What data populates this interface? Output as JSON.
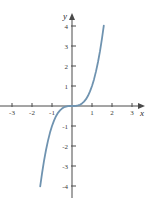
{
  "figure": {
    "background_color": "#ffffff",
    "axis_color": "#4a4a4a",
    "tick_label_color": "#3b3b3b",
    "curve_color": "#6f93b0"
  },
  "chart_data": {
    "type": "line",
    "title": "",
    "xlabel": "x",
    "ylabel": "y",
    "function": "y = x^3",
    "grid": false,
    "legend": null,
    "xlim": [
      -3.6,
      3.6
    ],
    "ylim": [
      -4.6,
      4.6
    ],
    "xticks": [
      -3,
      -2,
      -1,
      1,
      2,
      3
    ],
    "yticks": [
      -4,
      -3,
      -2,
      -1,
      1,
      2,
      3,
      4
    ],
    "xtick_labels": [
      "-3",
      "-2",
      "-1",
      "1",
      "2",
      "3"
    ],
    "ytick_labels": [
      "-4",
      "-3",
      "-2",
      "-1",
      "1",
      "2",
      "3",
      "4"
    ],
    "x": [
      -1.59,
      -1.5,
      -1.4,
      -1.3,
      -1.2,
      -1.1,
      -1.0,
      -0.9,
      -0.8,
      -0.7,
      -0.6,
      -0.5,
      -0.4,
      -0.3,
      -0.2,
      -0.1,
      0.0,
      0.1,
      0.2,
      0.3,
      0.4,
      0.5,
      0.6,
      0.7,
      0.8,
      0.9,
      1.0,
      1.1,
      1.2,
      1.3,
      1.4,
      1.5,
      1.59
    ],
    "values": [
      -4.02,
      -3.38,
      -2.74,
      -2.2,
      -1.73,
      -1.33,
      -1.0,
      -0.73,
      -0.51,
      -0.34,
      -0.22,
      -0.13,
      -0.06,
      -0.03,
      -0.01,
      0.0,
      0.0,
      0.0,
      0.01,
      0.03,
      0.06,
      0.13,
      0.22,
      0.34,
      0.51,
      0.73,
      1.0,
      1.33,
      1.73,
      2.2,
      2.74,
      3.38,
      4.02
    ],
    "curve_domain": [
      -1.59,
      1.59
    ],
    "curve_range": [
      -4.02,
      4.02
    ],
    "axis_arrow_x": "x",
    "axis_arrow_y": "y"
  },
  "geometry": {
    "origin_x": 72,
    "origin_y": 106,
    "unit_px_x": 20,
    "unit_px_y": 20
  }
}
